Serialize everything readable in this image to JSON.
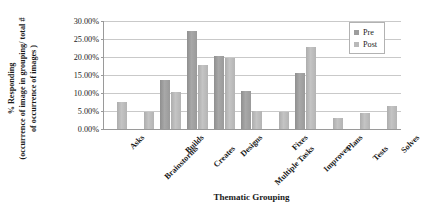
{
  "chart_data": {
    "type": "bar",
    "title": "",
    "xlabel": "Thematic Grouping",
    "ylabel": "% Responding (occurrence of image in grouping/ total # of occurrence of images )",
    "ylabel_line1": "% Responding",
    "ylabel_line2": "(occurrence of image in grouping/ total #",
    "ylabel_line3": "of occurrence of images )",
    "ylim": [
      0,
      30
    ],
    "ytick_labels": [
      "30.00%",
      "25.00%",
      "20.00%",
      "15.00%",
      "10.00%",
      "5.00%",
      "0.00%"
    ],
    "ytick_values": [
      30,
      25,
      20,
      15,
      10,
      5,
      0
    ],
    "grid": true,
    "legend_position": "top-right",
    "categories": [
      "Asks",
      "Brainstorms",
      "Builds",
      "Creates",
      "Designs",
      "Multiple Tasks",
      "Fixes",
      "Improves",
      "Plans",
      "Tests",
      "Solves"
    ],
    "series": [
      {
        "name": "Pre",
        "color": "#9d9d9d",
        "values": [
          0,
          0,
          13.6,
          27.2,
          20.4,
          10.5,
          0,
          15.5,
          0,
          0,
          0
        ]
      },
      {
        "name": "Post",
        "color": "#b9b9b9",
        "values": [
          7.4,
          4.8,
          10.2,
          17.8,
          19.6,
          4.9,
          4.8,
          22.8,
          3.0,
          4.5,
          6.5
        ]
      }
    ]
  },
  "legend": {
    "entries": [
      {
        "label": "Pre",
        "color": "#9d9d9d"
      },
      {
        "label": "Post",
        "color": "#b9b9b9"
      }
    ]
  }
}
